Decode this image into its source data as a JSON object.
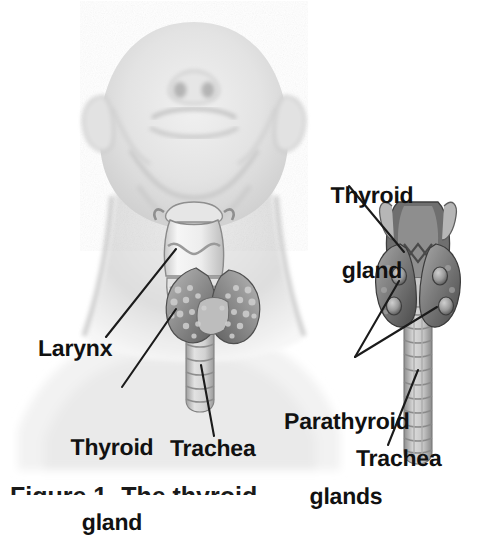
{
  "figure": {
    "kind": "anatomical-illustration",
    "background_color": "#ffffff",
    "label_color": "#111111",
    "leader_line_color": "#1b1b1b",
    "panels": [
      {
        "name": "anterior-neck-panel",
        "description": "Head tilted back, anterior view of neck with larynx, thyroid gland and trachea"
      },
      {
        "name": "posterior-detail-panel",
        "description": "Isolated posterior view of larynx, thyroid lobes, parathyroid glands and trachea"
      }
    ]
  },
  "labels": {
    "larynx": "Larynx",
    "thyroid_gland_left_line1": "Thyroid",
    "thyroid_gland_left_line2": "gland",
    "trachea_left": "Trachea",
    "thyroid_gland_right_line1": "Thyroid",
    "thyroid_gland_right_line2": "gland",
    "parathyroid_line1": "Parathyroid",
    "parathyroid_line2": "glands",
    "trachea_right": "Trachea"
  },
  "caption": {
    "text": "Figure 1. The thyroid"
  },
  "palette": {
    "skin_light": "#e9e9e9",
    "skin_mid": "#d8d8d8",
    "skin_shadow": "#c2c2c2",
    "cartilage_light": "#f2f2f2",
    "cartilage_mid": "#d0d0d0",
    "gland_mid": "#9b9b9b",
    "gland_dark": "#6e6e6e",
    "gland_deep": "#4c4c4c",
    "trachea_light": "#dcdcdc",
    "trachea_mid": "#b4b4b4",
    "outline": "#1b1b1b"
  }
}
